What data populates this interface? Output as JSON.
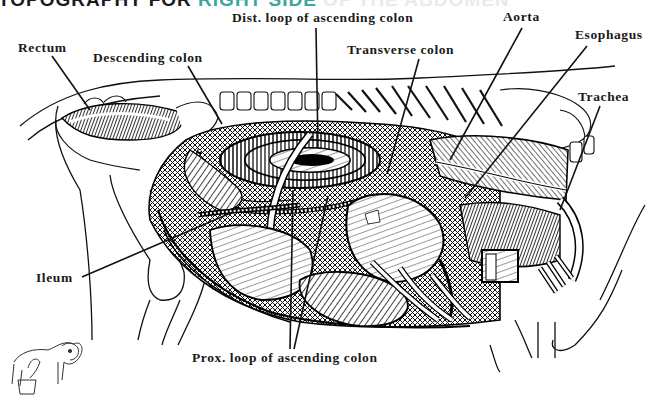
{
  "heading": {
    "part1": "TOPOGRAPHY FOR ",
    "part2": "RIGHT SIDE",
    "part3": " OF THE ABDOMEN"
  },
  "figure": {
    "labels": [
      {
        "id": "rectum",
        "text": "Rectum",
        "x": 18,
        "y": 12,
        "leader": [
          [
            52,
            56
          ],
          [
            90,
            110
          ]
        ]
      },
      {
        "id": "descending-colon",
        "text": "Descending colon",
        "x": 93,
        "y": 22,
        "leader": [
          [
            188,
            66
          ],
          [
            222,
            124
          ]
        ]
      },
      {
        "id": "dist-loop-ascending-colon",
        "text": "Dist. loop of ascending colon",
        "x": 232,
        "y": 10,
        "leader": [
          [
            316,
            28
          ],
          [
            318,
            148
          ]
        ]
      },
      {
        "id": "transverse-colon",
        "text": "Transverse colon",
        "x": 347,
        "y": 42,
        "leader": [
          [
            419,
            59
          ],
          [
            387,
            174
          ]
        ]
      },
      {
        "id": "aorta",
        "text": "Aorta",
        "x": 503,
        "y": 9,
        "leader": [
          [
            522,
            28
          ],
          [
            450,
            160
          ]
        ]
      },
      {
        "id": "esophagus",
        "text": "Esophagus",
        "x": 575,
        "y": 27,
        "leader": [
          [
            585,
            46
          ],
          [
            465,
            198
          ]
        ]
      },
      {
        "id": "trachea",
        "text": "Trachea",
        "x": 578,
        "y": 88,
        "leader": [
          [
            600,
            106
          ],
          [
            560,
            210
          ]
        ]
      },
      {
        "id": "ileum",
        "text": "Ileum",
        "x": 36,
        "y": 272,
        "leader": [
          [
            82,
            277
          ],
          [
            233,
            212
          ]
        ]
      },
      {
        "id": "prox-loop-ascending-colon",
        "text": "Prox. loop of ascending colon",
        "x": 192,
        "y": 349,
        "leader_a": [
          [
            290,
            349
          ],
          [
            293,
            190
          ]
        ],
        "leader_b": [
          [
            294,
            349
          ],
          [
            328,
            196
          ]
        ]
      }
    ],
    "corner_icon": "cow-icon"
  }
}
